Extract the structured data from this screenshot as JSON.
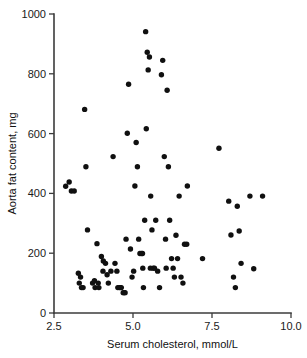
{
  "chart_data": {
    "type": "scatter",
    "title": "",
    "xlabel": "Serum cholesterol, mmol/L",
    "ylabel": "Aorta fat content, mg",
    "xlim": [
      2.5,
      10.0
    ],
    "ylim": [
      0,
      1000
    ],
    "xticks": [
      "2.5",
      "5.0",
      "7.5",
      "10.0"
    ],
    "xtick_values": [
      2.5,
      5.0,
      7.5,
      10.0
    ],
    "yticks": [
      "0",
      "200",
      "400",
      "600",
      "800",
      "1000"
    ],
    "ytick_values": [
      0,
      200,
      400,
      600,
      800,
      1000
    ],
    "grid": false,
    "legend": null,
    "marker": "filled-circle",
    "marker_color": "#101010",
    "n_points": 94,
    "points": [
      [
        2.87,
        424
      ],
      [
        2.98,
        438
      ],
      [
        3.05,
        408
      ],
      [
        3.14,
        408
      ],
      [
        3.27,
        133
      ],
      [
        3.3,
        100
      ],
      [
        3.37,
        85
      ],
      [
        3.42,
        85
      ],
      [
        3.47,
        681
      ],
      [
        3.51,
        489
      ],
      [
        3.56,
        278
      ],
      [
        3.72,
        100
      ],
      [
        3.78,
        108
      ],
      [
        3.8,
        85
      ],
      [
        3.86,
        232
      ],
      [
        3.92,
        85
      ],
      [
        4.0,
        189
      ],
      [
        4.06,
        174
      ],
      [
        4.13,
        166
      ],
      [
        4.18,
        128
      ],
      [
        4.22,
        100
      ],
      [
        4.3,
        140
      ],
      [
        4.37,
        523
      ],
      [
        4.43,
        166
      ],
      [
        4.49,
        140
      ],
      [
        4.52,
        85
      ],
      [
        4.57,
        85
      ],
      [
        4.63,
        85
      ],
      [
        4.69,
        68
      ],
      [
        4.72,
        68
      ],
      [
        4.78,
        247
      ],
      [
        4.82,
        601
      ],
      [
        4.86,
        765
      ],
      [
        4.92,
        214
      ],
      [
        4.97,
        120
      ],
      [
        5.02,
        140
      ],
      [
        5.06,
        425
      ],
      [
        5.1,
        570
      ],
      [
        5.14,
        489
      ],
      [
        5.18,
        247
      ],
      [
        5.22,
        199
      ],
      [
        5.27,
        199
      ],
      [
        5.31,
        150
      ],
      [
        5.33,
        85
      ],
      [
        5.37,
        310
      ],
      [
        5.4,
        941
      ],
      [
        5.42,
        616
      ],
      [
        5.45,
        872
      ],
      [
        5.48,
        813
      ],
      [
        5.52,
        856
      ],
      [
        5.56,
        391
      ],
      [
        5.6,
        278
      ],
      [
        5.64,
        150
      ],
      [
        5.68,
        150
      ],
      [
        5.72,
        310
      ],
      [
        5.78,
        140
      ],
      [
        5.84,
        85
      ],
      [
        5.9,
        797
      ],
      [
        5.94,
        845
      ],
      [
        5.99,
        523
      ],
      [
        6.03,
        247
      ],
      [
        6.08,
        745
      ],
      [
        6.12,
        489
      ],
      [
        6.16,
        310
      ],
      [
        6.22,
        182
      ],
      [
        6.27,
        150
      ],
      [
        6.31,
        120
      ],
      [
        6.36,
        260
      ],
      [
        6.41,
        182
      ],
      [
        6.46,
        391
      ],
      [
        6.52,
        120
      ],
      [
        6.58,
        100
      ],
      [
        6.63,
        230
      ],
      [
        6.72,
        425
      ],
      [
        7.2,
        182
      ],
      [
        7.72,
        551
      ],
      [
        8.03,
        374
      ],
      [
        8.1,
        261
      ],
      [
        8.18,
        120
      ],
      [
        8.24,
        85
      ],
      [
        8.3,
        357
      ],
      [
        8.36,
        274
      ],
      [
        8.42,
        166
      ],
      [
        8.7,
        391
      ],
      [
        8.82,
        148
      ],
      [
        9.1,
        391
      ],
      [
        3.34,
        120
      ],
      [
        4.05,
        140
      ],
      [
        4.75,
        68
      ],
      [
        5.55,
        150
      ],
      [
        6.05,
        150
      ],
      [
        6.7,
        230
      ],
      [
        5.3,
        199
      ],
      [
        4.6,
        85
      ],
      [
        3.9,
        100
      ]
    ]
  },
  "axes": {
    "x_axis_name": "x-axis",
    "y_axis_name": "y-axis"
  }
}
